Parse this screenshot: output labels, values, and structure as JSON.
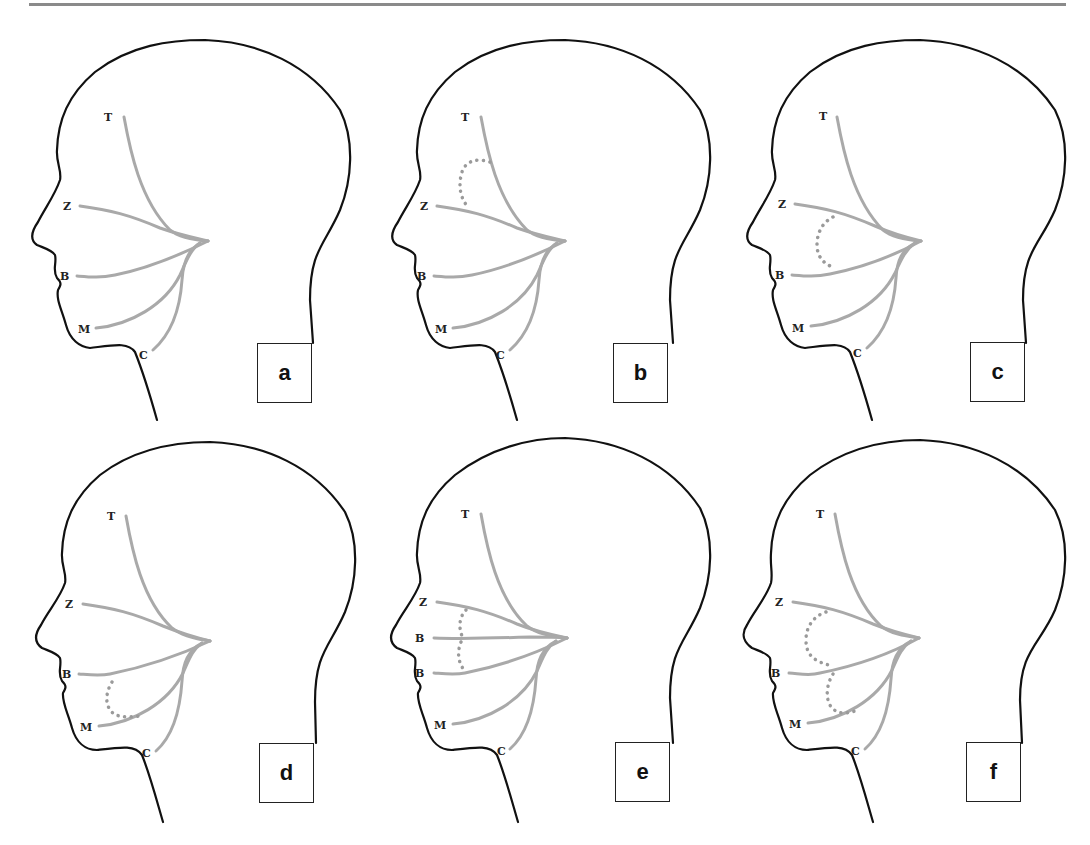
{
  "figure": {
    "branch_color": "#a9a9a9",
    "outline_color": "#111111",
    "panels": [
      {
        "id": "a",
        "label": "a",
        "branches": {
          "t": "T",
          "z": "Z",
          "b": "B",
          "m": "M",
          "c": "C"
        },
        "anastomosis": "none"
      },
      {
        "id": "b",
        "label": "b",
        "branches": {
          "t": "T",
          "z": "Z",
          "b": "B",
          "m": "M",
          "c": "C"
        },
        "anastomosis": "temporal-zygomatic loop"
      },
      {
        "id": "c",
        "label": "c",
        "branches": {
          "t": "T",
          "z": "Z",
          "b": "B",
          "m": "M",
          "c": "C"
        },
        "anastomosis": "zygomatic-buccal loop"
      },
      {
        "id": "d",
        "label": "d",
        "branches": {
          "t": "T",
          "z": "Z",
          "b": "B",
          "m": "M",
          "c": "C"
        },
        "anastomosis": "buccal-mandibular loop"
      },
      {
        "id": "e",
        "label": "e",
        "branches": {
          "t": "T",
          "z": "Z",
          "b": "B",
          "b2": "B",
          "m": "M",
          "c": "C"
        },
        "anastomosis": "zygomatic-buccal-buccal connections"
      },
      {
        "id": "f",
        "label": "f",
        "branches": {
          "t": "T",
          "z": "Z",
          "b": "B",
          "m": "M",
          "c": "C"
        },
        "anastomosis": "zygomatic-buccal and buccal-mandibular loops"
      }
    ]
  }
}
